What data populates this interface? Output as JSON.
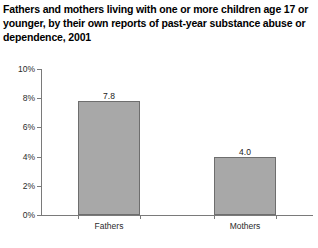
{
  "chart_data": {
    "type": "bar",
    "title": "Fathers and mothers living with one or more children age 17 or younger, by their own reports of past-year substance abuse or dependence, 2001",
    "subtitle": "",
    "xlabel": "",
    "ylabel": "",
    "categories": [
      "Fathers",
      "Mothers"
    ],
    "values": [
      7.8,
      4.0
    ],
    "value_labels": [
      "7.8",
      "4.0"
    ],
    "ylim": [
      0,
      10
    ],
    "yticks": [
      0,
      2,
      4,
      6,
      8,
      10
    ],
    "ytick_labels": [
      "0%",
      "2%",
      "4%",
      "6%",
      "8%",
      "10%"
    ],
    "grid": false,
    "legend": "none",
    "bar_color": "#a8a8a8",
    "bar_border_color": "#6e6e6e",
    "axis_color": "#7a7a7a",
    "text_color": "#1a1a1a",
    "background": "#ffffff"
  }
}
